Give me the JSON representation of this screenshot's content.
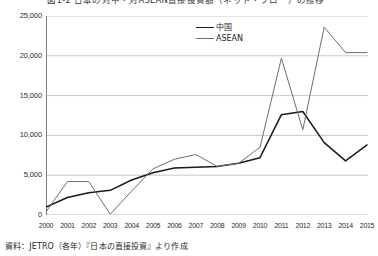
{
  "chart_data": {
    "type": "line",
    "title": "図1-2 日本の対中・対ASEAN直接投資額（ネット・フロー）の推移",
    "xlabel": "",
    "ylabel": "",
    "grid": true,
    "legend_position": "top-center",
    "ylim": [
      0,
      25000
    ],
    "yticks": [
      0,
      5000,
      10000,
      15000,
      20000,
      25000
    ],
    "ytick_labels": [
      "0",
      "5,000",
      "10,000",
      "15,000",
      "20,000",
      "25,000"
    ],
    "categories": [
      "2000",
      "2001",
      "2002",
      "2003",
      "2004",
      "2005",
      "2006",
      "2007",
      "2008",
      "2009",
      "2010",
      "2011",
      "2012",
      "2013",
      "2014",
      "2015"
    ],
    "series": [
      {
        "name": "中国",
        "color": "#1a1a1a",
        "values": [
          1000,
          2200,
          2800,
          3100,
          4400,
          5300,
          5900,
          6000,
          6100,
          6500,
          7200,
          12600,
          13000,
          9100,
          6800,
          8800
        ]
      },
      {
        "name": "ASEAN",
        "color": "#6e6e6e",
        "values": [
          400,
          4200,
          4200,
          100,
          3000,
          5800,
          7000,
          7600,
          6100,
          6500,
          8500,
          19700,
          10700,
          23600,
          20400,
          20400
        ]
      }
    ],
    "annotations": []
  },
  "axis": {
    "ytick_labels": [
      "25,000",
      "20,000",
      "15,000",
      "10,000",
      "5,000",
      "0"
    ],
    "xtick_labels": [
      "2000",
      "2001",
      "2002",
      "2003",
      "2004",
      "2005",
      "2006",
      "2007",
      "2008",
      "2009",
      "2010",
      "2011",
      "2012",
      "2013",
      "2014",
      "2015"
    ]
  },
  "legend": {
    "items": [
      {
        "label": "中国",
        "color": "#1a1a1a"
      },
      {
        "label": "ASEAN",
        "color": "#6e6e6e"
      }
    ]
  },
  "source": {
    "text": "資料：JETRO（各年）『日本の直接投資』より作成"
  },
  "colors": {
    "china_line": "#1a1a1a",
    "asean_line": "#6e6e6e",
    "grid": "#b0b0b0",
    "axis": "#707070",
    "background": "#ffffff"
  }
}
